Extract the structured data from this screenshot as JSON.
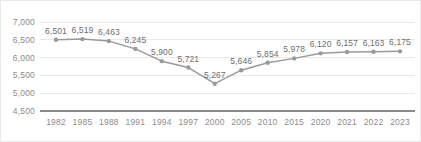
{
  "chart_data": {
    "type": "line",
    "title": "",
    "subtitle": "",
    "xlabel": "",
    "ylabel": "",
    "categories": [
      "1982",
      "1985",
      "1988",
      "1991",
      "1994",
      "1997",
      "2000",
      "2005",
      "2010",
      "2015",
      "2020",
      "2021",
      "2022",
      "2023"
    ],
    "values": [
      6501,
      6519,
      6463,
      6245,
      5900,
      5721,
      5267,
      5646,
      5854,
      5978,
      6120,
      6157,
      6163,
      6175
    ],
    "data_labels": [
      "6,501",
      "6,519",
      "6,463",
      "6,245",
      "5,900",
      "5,721",
      "5,267",
      "5,646",
      "5,854",
      "5,978",
      "6,120",
      "6,157",
      "6,163",
      "6,175"
    ],
    "ylim": [
      4500,
      7000
    ],
    "ytick_values": [
      7000,
      6500,
      6000,
      5500,
      5000,
      4500
    ],
    "ytick_labels": [
      "7,000",
      "6,500",
      "6,000",
      "5,500",
      "5,000",
      "4,500"
    ],
    "grid": true,
    "grid_axis": "y",
    "legend": false,
    "legend_position": "none",
    "series": [
      {
        "name": "",
        "values": [
          6501,
          6519,
          6463,
          6245,
          5900,
          5721,
          5267,
          5646,
          5854,
          5978,
          6120,
          6157,
          6163,
          6175
        ]
      }
    ],
    "colors": {
      "line": "#9a9a9a",
      "marker": "#9a9a9a",
      "grid": "#e4e4e4",
      "axis": "#8a8a8a",
      "tick_text": "#8c8c8c",
      "data_label_text": "#6d6d6d",
      "background": "#ffffff",
      "border": "#e9e9e9"
    }
  }
}
